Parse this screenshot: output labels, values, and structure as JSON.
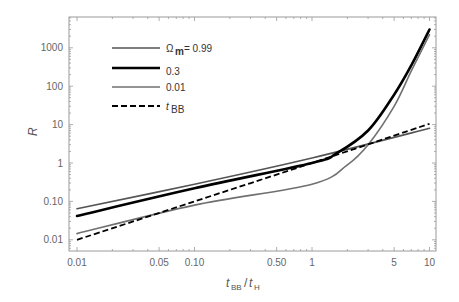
{
  "chart_data": {
    "type": "line",
    "title": "",
    "xlabel": "t_BB/t_H",
    "ylabel": "R",
    "xscale": "log",
    "yscale": "log",
    "xlim": [
      0.0093,
      11.5
    ],
    "ylim": [
      0.0075,
      4500
    ],
    "grid": false,
    "legend_position": "upper-left (inside)",
    "x_ticks": [
      {
        "value": 0.01,
        "label": "0.01"
      },
      {
        "value": 0.05,
        "label": "0.05"
      },
      {
        "value": 0.1,
        "label": "0.10"
      },
      {
        "value": 0.5,
        "label": "0.50"
      },
      {
        "value": 1,
        "label": "1"
      },
      {
        "value": 5,
        "label": "5"
      },
      {
        "value": 10,
        "label": "10"
      }
    ],
    "y_ticks": [
      {
        "value": 0.01,
        "label": "0.01"
      },
      {
        "value": 0.1,
        "label": "0.10"
      },
      {
        "value": 1,
        "label": "1"
      },
      {
        "value": 10,
        "label": "10"
      },
      {
        "value": 100,
        "label": "100"
      },
      {
        "value": 1000,
        "label": "1000"
      }
    ],
    "series": [
      {
        "name": "Ω_m = 0.99",
        "legend_label": "= 0.99",
        "style": "solid",
        "color": "#555555",
        "width": 1.6,
        "x": [
          0.01,
          0.1,
          1,
          10
        ],
        "values": [
          0.064,
          0.28,
          1.35,
          8
        ]
      },
      {
        "name": "0.3",
        "legend_label": "0.3",
        "style": "solid",
        "color": "#000000",
        "width": 2.6,
        "x": [
          0.01,
          0.1,
          1,
          1.6,
          3,
          5,
          7,
          10
        ],
        "values": [
          0.042,
          0.22,
          1.0,
          1.75,
          7,
          60,
          350,
          3000
        ]
      },
      {
        "name": "0.01",
        "legend_label": "0.01",
        "style": "solid",
        "color": "#707070",
        "width": 1.6,
        "x": [
          0.01,
          0.1,
          1,
          2,
          3,
          5,
          7,
          10
        ],
        "values": [
          0.0145,
          0.08,
          0.28,
          0.9,
          3,
          30,
          250,
          2200
        ]
      },
      {
        "name": "t_BB",
        "legend_label": "t",
        "legend_sub": "BB",
        "style": "dashed",
        "color": "#000000",
        "width": 1.8,
        "x": [
          0.01,
          0.1,
          1,
          10
        ],
        "values": [
          0.01,
          0.1,
          1,
          10.5
        ]
      }
    ],
    "annotations": {
      "omega_symbol": "Ω",
      "omega_sub": "m",
      "x_label_t1": "t",
      "x_label_sub1": "BB",
      "x_label_slash": "/",
      "x_label_t2": "t",
      "x_label_sub2": "H",
      "y_label": "R"
    }
  }
}
